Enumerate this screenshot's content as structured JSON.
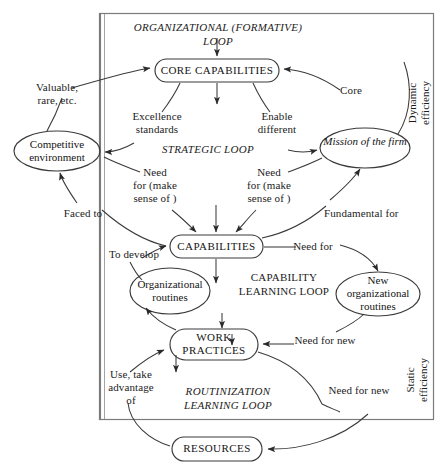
{
  "diagram": {
    "frame": {
      "label": "outer-boundary"
    },
    "loops": [
      {
        "id": "organizational",
        "label": "ORGANIZATIONAL (FORMATIVE) LOOP"
      },
      {
        "id": "strategic",
        "label": "STRATEGIC LOOP"
      },
      {
        "id": "capability",
        "label": "CAPABILITY\nLEARNING LOOP"
      },
      {
        "id": "routinization",
        "label": "ROUTINIZATION\nLEARNING LOOP"
      }
    ],
    "nodes": [
      {
        "id": "core-capabilities",
        "label": "CORE CAPABILITIES",
        "shape": "rounded-box"
      },
      {
        "id": "competitive-environment",
        "label": "Competitive\nenvironment",
        "shape": "ellipse"
      },
      {
        "id": "mission-of-the-firm",
        "label": "Mission of\nthe firm",
        "shape": "ellipse",
        "style": "italic"
      },
      {
        "id": "capabilities",
        "label": "CAPABILITIES",
        "shape": "rounded-box"
      },
      {
        "id": "organizational-routines",
        "label": "Organizational\nroutines",
        "shape": "ellipse"
      },
      {
        "id": "new-organizational-routines",
        "label": "New\norganizational\nroutines",
        "shape": "ellipse"
      },
      {
        "id": "work-practices",
        "label": "WORK\nPRACTICES",
        "shape": "rounded-box"
      },
      {
        "id": "resources",
        "label": "RESOURCES",
        "shape": "rounded-box"
      }
    ],
    "edge_labels": [
      {
        "id": "valuable-rare",
        "label": "Valuable,\nrare, etc."
      },
      {
        "id": "core",
        "label": "Core"
      },
      {
        "id": "excellence-standards",
        "label": "Excellence\nstandards"
      },
      {
        "id": "enable-different",
        "label": "Enable\ndifferent"
      },
      {
        "id": "need-for-make-sense-of-left",
        "label": "Need\nfor (make\nsense of )"
      },
      {
        "id": "need-for-make-sense-of-right",
        "label": "Need\nfor (make\nsense of )"
      },
      {
        "id": "faced-to",
        "label": "Faced to"
      },
      {
        "id": "fundamental-for",
        "label": "Fundamental for"
      },
      {
        "id": "to-develop",
        "label": "To develop"
      },
      {
        "id": "need-for",
        "label": "Need for"
      },
      {
        "id": "need-for-new-routines",
        "label": "Need for new"
      },
      {
        "id": "use-take-advantage-of",
        "label": "Use, take\nadvantage\nof"
      },
      {
        "id": "need-for-new-resources",
        "label": "Need for new"
      }
    ],
    "side_labels": [
      {
        "id": "dynamic-efficiency",
        "label": "Dynamic\nefficiency"
      },
      {
        "id": "static-efficiency",
        "label": "Static\nefficiency"
      }
    ],
    "colors": {
      "stroke": "#3a3a3a",
      "text": "#1a1a1a",
      "background": "#ffffff"
    }
  }
}
